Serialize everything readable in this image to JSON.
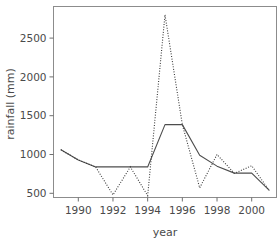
{
  "chart_data": {
    "type": "line",
    "title": "",
    "xlabel": "year",
    "ylabel": "rainfall (mm)",
    "x": [
      1989,
      1990,
      1991,
      1992,
      1993,
      1994,
      1995,
      1996,
      1997,
      1998,
      1999,
      2000,
      2001
    ],
    "series": [
      {
        "name": "solid",
        "style": "solid",
        "color": "#4d4d4d",
        "values": [
          1060,
          930,
          840,
          840,
          840,
          840,
          1385,
          1385,
          990,
          850,
          760,
          760,
          540
        ]
      },
      {
        "name": "dotted",
        "style": "dotted",
        "color": "#3a3a3a",
        "values": [
          1060,
          930,
          840,
          480,
          840,
          470,
          2800,
          1385,
          570,
          1000,
          757,
          855,
          540
        ]
      }
    ],
    "xlim": [
      1988.5,
      2001.6
    ],
    "ylim": [
      420,
      2880
    ],
    "xticks": [
      1990,
      1992,
      1994,
      1996,
      1998,
      2000
    ],
    "xtick_labels": [
      "1990",
      "1992",
      "1994",
      "1996",
      "1998",
      "2000"
    ],
    "yticks": [
      500,
      1000,
      1500,
      2000,
      2500
    ],
    "ytick_labels": [
      "500",
      "1000",
      "1500",
      "2000",
      "2500"
    ],
    "grid": false,
    "legend": "none",
    "frame": "box"
  },
  "axes": {
    "x_title": "year",
    "y_title": "rainfall (mm)"
  }
}
